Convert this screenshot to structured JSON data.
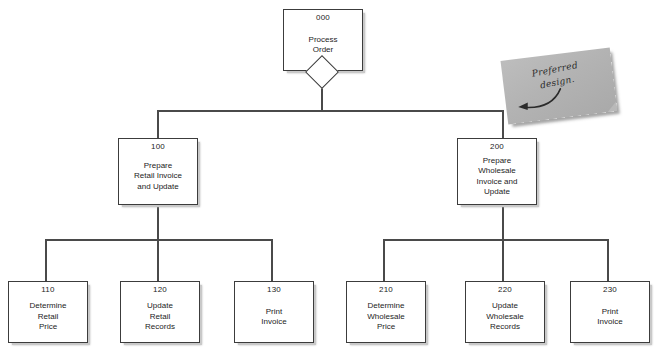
{
  "diagram": {
    "nodes": [
      {
        "id": "000",
        "lines": [
          "Process",
          "Order"
        ]
      },
      {
        "id": "100",
        "lines": [
          "Prepare",
          "Retail Invoice",
          "and Update"
        ]
      },
      {
        "id": "200",
        "lines": [
          "Prepare",
          "Wholesale",
          "Invoice and",
          "Update"
        ]
      },
      {
        "id": "110",
        "lines": [
          "Determine",
          "Retail",
          "Price"
        ]
      },
      {
        "id": "120",
        "lines": [
          "Update",
          "Retail",
          "Records"
        ]
      },
      {
        "id": "130",
        "lines": [
          "Print",
          "Invoice"
        ]
      },
      {
        "id": "210",
        "lines": [
          "Determine",
          "Wholesale",
          "Price"
        ]
      },
      {
        "id": "220",
        "lines": [
          "Update",
          "Wholesale",
          "Records"
        ]
      },
      {
        "id": "230",
        "lines": [
          "Print",
          "Invoice"
        ]
      }
    ],
    "annotation": {
      "line1": "Preferred",
      "line2": "design."
    },
    "colors": {
      "box_border": "#3c3c3c",
      "box_fill": "#ffffff",
      "connector": "#4a4a4a",
      "shadow": "#c9c9c9",
      "sticky_note": "#b3b3b3",
      "text": "#1c1c1c"
    }
  }
}
